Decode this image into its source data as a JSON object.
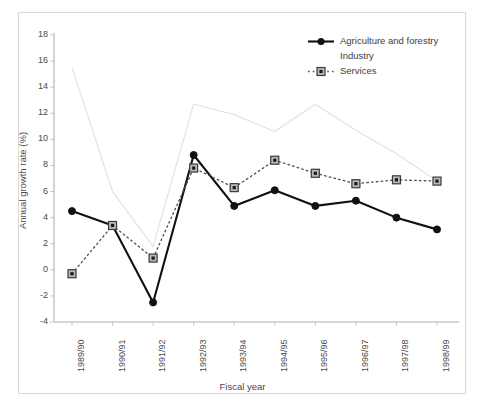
{
  "chart_data": {
    "type": "line",
    "title": "",
    "subtitle": "",
    "xlabel": "Fiscal year",
    "ylabel": "Annual growth rate (%)",
    "categories": [
      "1989/90",
      "1990/91",
      "1991/92",
      "1992/93",
      "1993/94",
      "1994/95",
      "1995/96",
      "1996/97",
      "1997/98",
      "1998/99"
    ],
    "series": [
      {
        "name": "Agriculture and forestry",
        "values": [
          4.5,
          3.4,
          -2.5,
          8.8,
          4.9,
          6.1,
          4.9,
          5.3,
          4.0,
          3.1
        ],
        "color": "#111111",
        "marker": "circle",
        "line_style": "solid"
      },
      {
        "name": "Industry",
        "values": [
          15.5,
          6.0,
          1.8,
          12.7,
          11.9,
          10.6,
          12.7,
          10.7,
          8.9,
          6.8
        ],
        "color": "#e2e2e2",
        "marker": "none",
        "line_style": "solid"
      },
      {
        "name": "Services",
        "values": [
          -0.3,
          3.4,
          0.9,
          7.8,
          6.3,
          8.4,
          7.4,
          6.6,
          6.9,
          6.8
        ],
        "color": "#4d4d4d",
        "marker": "square",
        "line_style": "dotted"
      }
    ],
    "ylim": [
      -4,
      18
    ],
    "ytick_step": 2,
    "yticks": [
      "18",
      "16",
      "14",
      "12",
      "10",
      "8",
      "6",
      "4",
      "2",
      "0",
      "-2",
      "-4"
    ],
    "grid": false,
    "legend_position": "top-right",
    "legend_entries": [
      "Agriculture and forestry",
      "Industry",
      "Services"
    ]
  },
  "axis": {
    "y_title": "Annual growth rate (%)",
    "x_title": "Fiscal year"
  },
  "legend": {
    "items": [
      {
        "label": "Agriculture and forestry"
      },
      {
        "label": "Industry"
      },
      {
        "label": "Services"
      }
    ]
  },
  "colors": {
    "agriculture": "#111111",
    "industry": "#e2e2e2",
    "services": "#4d4d4d",
    "axis": "#c9c9c9",
    "text": "#4a4a4a",
    "panel_border": "#d8d8d8"
  }
}
